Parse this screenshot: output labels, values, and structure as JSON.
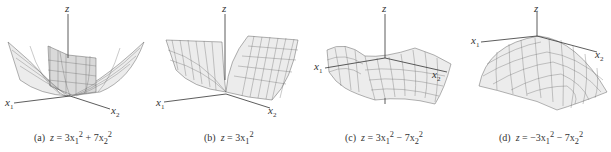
{
  "figure": {
    "panels": [
      {
        "id": "a",
        "label": "(a)",
        "equation": "z = 3x₁² + 7x₂²",
        "eq_parts": {
          "lhs": "z",
          "rest": " = 3x",
          "s1": "1",
          "p1": "2",
          "mid": " + 7x",
          "s2": "2",
          "p2": "2"
        },
        "shape": "elliptic paraboloid (bowl)",
        "axes": {
          "z": "z",
          "x1": "x",
          "x1_sub": "1",
          "x2": "x",
          "x2_sub": "2"
        }
      },
      {
        "id": "b",
        "label": "(b)",
        "equation": "z = 3x₁²",
        "eq_parts": {
          "lhs": "z",
          "rest": " = 3x",
          "s1": "1",
          "p1": "2"
        },
        "shape": "parabolic cylinder (trough)",
        "axes": {
          "z": "z",
          "x1": "x",
          "x1_sub": "1",
          "x2": "x",
          "x2_sub": "2"
        }
      },
      {
        "id": "c",
        "label": "(c)",
        "equation": "z = 3x₁² − 7x₂²",
        "eq_parts": {
          "lhs": "z",
          "rest": " = 3x",
          "s1": "1",
          "p1": "2",
          "mid": " − 7x",
          "s2": "2",
          "p2": "2"
        },
        "shape": "hyperbolic paraboloid (saddle)",
        "axes": {
          "z": "z",
          "x1": "x",
          "x1_sub": "1",
          "x2": "x",
          "x2_sub": "2"
        }
      },
      {
        "id": "d",
        "label": "(d)",
        "equation": "z = −3x₁² − 7x₂²",
        "eq_parts": {
          "lhs": "z",
          "rest": " = −3x",
          "s1": "1",
          "p1": "2",
          "mid": " − 7x",
          "s2": "2",
          "p2": "2"
        },
        "shape": "inverted elliptic paraboloid (dome)",
        "axes": {
          "z": "z",
          "x1": "x",
          "x1_sub": "1",
          "x2": "x",
          "x2_sub": "2"
        }
      }
    ]
  }
}
